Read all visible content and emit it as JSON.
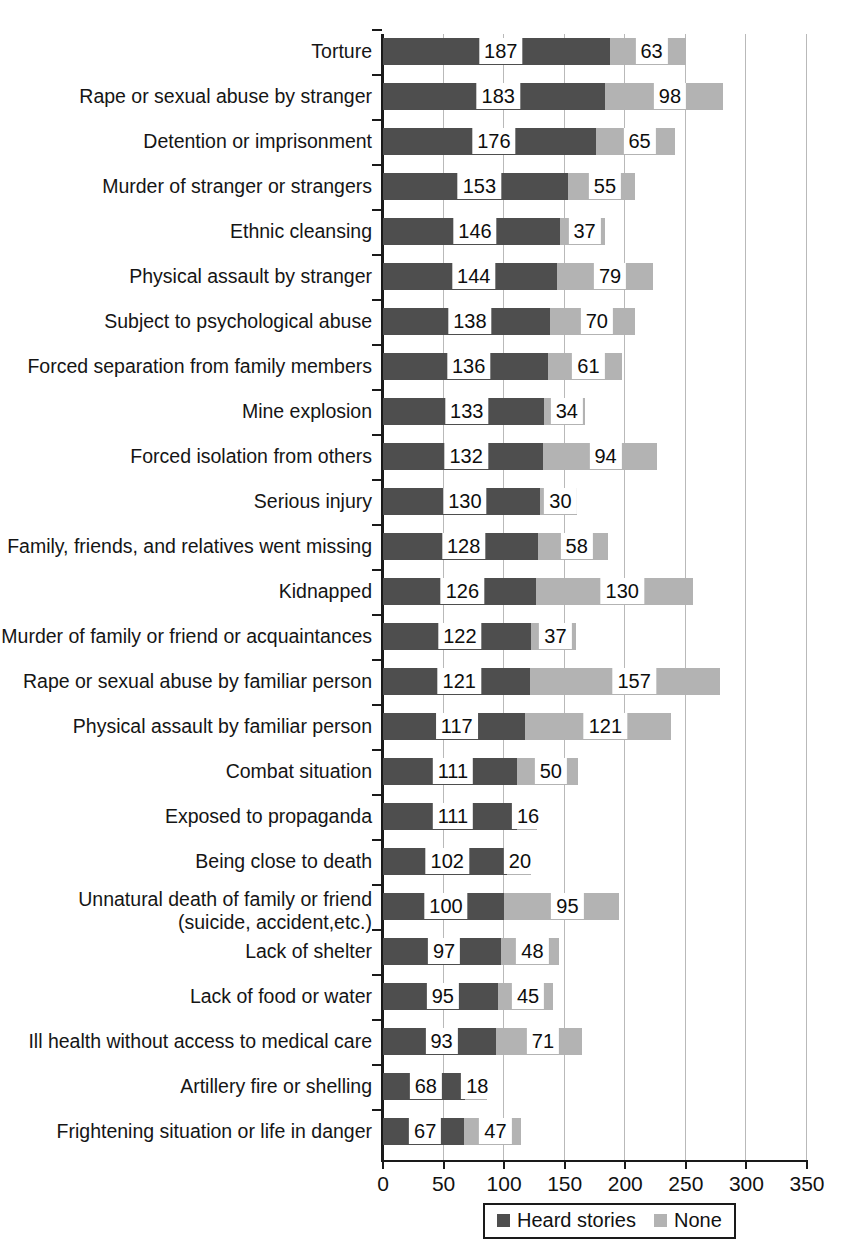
{
  "chart_data": {
    "type": "bar",
    "orientation": "horizontal",
    "stacked": true,
    "title": "",
    "xlabel": "",
    "ylabel": "",
    "xlim": [
      0,
      350
    ],
    "xticks": [
      0,
      50,
      100,
      150,
      200,
      250,
      300,
      350
    ],
    "xtick_labels": [
      "0",
      "50",
      "100",
      "150",
      "200",
      "250",
      "300",
      "350"
    ],
    "grid": "vertical",
    "legend_position": "bottom",
    "colors": {
      "heard_stories": "#4e4e4e",
      "none": "#b3b3b3",
      "axis": "#1a1a1a",
      "gridline": "#b9b9b9",
      "background": "#ffffff"
    },
    "legend": [
      {
        "label": "Heard stories",
        "color": "#4e4e4e",
        "swatch": "dark-swatch-icon"
      },
      {
        "label": "None",
        "color": "#b3b3b3",
        "swatch": "light-swatch-icon"
      }
    ],
    "categories": [
      "Torture",
      "Rape or sexual abuse by stranger",
      "Detention or imprisonment",
      "Murder of stranger or strangers",
      "Ethnic cleansing",
      "Physical assault by stranger",
      "Subject to psychological abuse",
      "Forced separation from family members",
      "Mine explosion",
      "Forced isolation from others",
      "Serious injury",
      "Family, friends, and relatives went missing",
      "Kidnapped",
      "Murder of family or friend or acquaintances",
      "Rape or sexual abuse by familiar person",
      "Physical assault by familiar person",
      "Combat situation",
      "Exposed to propaganda",
      "Being close to death",
      "Unnatural death of family or friend\n(suicide, accident,etc.)",
      "Lack of shelter",
      "Lack of food or water",
      "Ill health without access to medical care",
      "Artillery fire or shelling",
      "Frightening situation or life in danger"
    ],
    "series": [
      {
        "name": "Heard stories",
        "values": [
          187,
          183,
          176,
          153,
          146,
          144,
          138,
          136,
          133,
          132,
          130,
          128,
          126,
          122,
          121,
          117,
          111,
          111,
          102,
          100,
          97,
          95,
          93,
          68,
          67
        ]
      },
      {
        "name": "None",
        "values": [
          63,
          98,
          65,
          55,
          37,
          79,
          70,
          61,
          34,
          94,
          30,
          58,
          130,
          37,
          157,
          121,
          50,
          16,
          20,
          95,
          48,
          45,
          71,
          18,
          47
        ]
      }
    ]
  }
}
